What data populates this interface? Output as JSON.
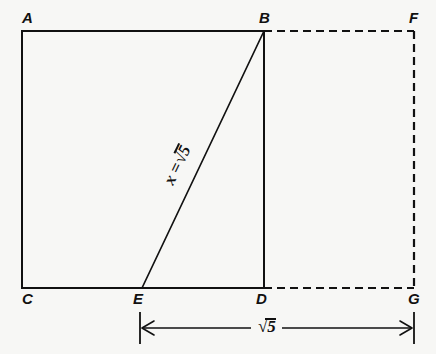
{
  "figure": {
    "background_color": "#f7f7f5",
    "ink_color": "#111111"
  },
  "vertices": [
    {
      "id": "A",
      "label": "A",
      "x": 22,
      "y": 31,
      "label_x": 22,
      "label_y": 10
    },
    {
      "id": "B",
      "label": "B",
      "x": 264,
      "y": 31,
      "label_x": 259,
      "label_y": 10
    },
    {
      "id": "F",
      "label": "F",
      "x": 414,
      "y": 31,
      "label_x": 409,
      "label_y": 10
    },
    {
      "id": "C",
      "label": "C",
      "x": 22,
      "y": 288,
      "label_x": 22,
      "label_y": 291
    },
    {
      "id": "E",
      "label": "E",
      "x": 142,
      "y": 288,
      "label_x": 133,
      "label_y": 291
    },
    {
      "id": "D",
      "label": "D",
      "x": 264,
      "y": 288,
      "label_x": 256,
      "label_y": 291
    },
    {
      "id": "G",
      "label": "G",
      "x": 414,
      "y": 288,
      "label_x": 408,
      "label_y": 291
    }
  ],
  "solid_edges": [
    {
      "name": "edge-A-B",
      "from": "A",
      "to": "B"
    },
    {
      "name": "edge-A-C",
      "from": "A",
      "to": "C"
    },
    {
      "name": "edge-C-D",
      "from": "C",
      "to": "D"
    },
    {
      "name": "edge-B-D",
      "from": "B",
      "to": "D"
    }
  ],
  "dashed_edges": [
    {
      "name": "edge-B-F",
      "from": "B",
      "to": "F"
    },
    {
      "name": "edge-F-G",
      "from": "F",
      "to": "G"
    },
    {
      "name": "edge-D-G",
      "from": "D",
      "to": "G"
    }
  ],
  "diagonal": {
    "name": "diagonal-E-B",
    "from": "E",
    "to": "B",
    "label": "X = √5",
    "label_text_x": "x =",
    "label_radicand": "5",
    "label_x": 168,
    "label_y": 175,
    "label_rotation_deg": -64
  },
  "dimension": {
    "name": "dimension-E-G",
    "label": "√5",
    "label_radicand": "5",
    "x_start": 140,
    "x_end": 414,
    "y": 328,
    "label_x": 258,
    "label_y": 318
  }
}
